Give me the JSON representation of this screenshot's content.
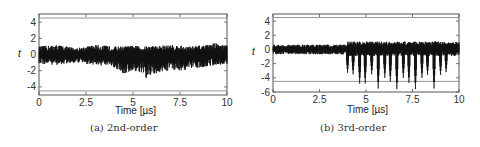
{
  "chart_data": [
    {
      "type": "line",
      "panel": "a",
      "caption": "(a) 2nd-order",
      "title": "",
      "xlabel": "Time [µs]",
      "ylabel": "t",
      "xlim": [
        0,
        10
      ],
      "ylim": [
        -5,
        5
      ],
      "xticks": [
        "0",
        "2.5",
        "5",
        "7.5",
        "10"
      ],
      "yticks": [
        "4",
        "2",
        "0",
        "-2",
        "-4"
      ],
      "ytick_values": [
        4,
        2,
        0,
        -2,
        -4
      ],
      "threshold_lines": [
        4.5,
        -4.5
      ],
      "grid": false,
      "series": [
        {
          "name": "t-statistic",
          "description": "dense noise around 0, amplitude roughly ±1.2, some excursions down to about -3.2 near 5.7 µs, up to about 1.5 near 9.4 µs",
          "envelope_x": [
            0,
            1,
            2,
            3,
            4,
            4.5,
            5,
            5.5,
            5.7,
            6,
            6.5,
            7,
            7.5,
            8,
            8.5,
            9,
            9.4,
            10
          ],
          "envelope_max": [
            1.0,
            1.2,
            0.8,
            1.2,
            1.0,
            1.0,
            1.1,
            1.0,
            1.0,
            1.1,
            1.1,
            1.2,
            1.1,
            1.0,
            1.1,
            1.2,
            1.5,
            1.1
          ],
          "envelope_min": [
            -1.2,
            -1.3,
            -1.0,
            -1.3,
            -1.6,
            -2.5,
            -2.0,
            -2.4,
            -3.2,
            -2.6,
            -2.2,
            -1.9,
            -2.0,
            -1.9,
            -1.6,
            -1.5,
            -1.3,
            -1.2
          ]
        }
      ]
    },
    {
      "type": "line",
      "panel": "b",
      "caption": "(b) 3rd-order",
      "title": "",
      "xlabel": "Time [µs]",
      "ylabel": "t",
      "xlim": [
        0,
        10
      ],
      "ylim": [
        -6,
        5
      ],
      "xticks": [
        "0",
        "2.5",
        "5",
        "7.5",
        "10"
      ],
      "yticks": [
        "4",
        "2",
        "0",
        "-2",
        "-4",
        "-6"
      ],
      "ytick_values": [
        4,
        2,
        0,
        -2,
        -4,
        -6
      ],
      "threshold_lines": [
        4.5,
        -4.5
      ],
      "grid": false,
      "series": [
        {
          "name": "t-statistic",
          "description": "noise around 0 (±0.8) for 0–4 µs, then periodic negative spikes from ~4 µs onward, many crossing -4.5",
          "spike_x": [
            4.0,
            4.3,
            4.65,
            4.95,
            5.3,
            5.65,
            6.0,
            6.3,
            6.65,
            7.0,
            7.3,
            7.65,
            8.0,
            8.3,
            8.65,
            9.0,
            9.3
          ],
          "spike_min": [
            -3.3,
            -3.5,
            -4.8,
            -4.8,
            -3.5,
            -5.5,
            -4.0,
            -4.5,
            -5.6,
            -4.0,
            -4.7,
            -5.6,
            -4.0,
            -3.6,
            -5.5,
            -3.6,
            -3.2
          ],
          "baseline_max": 0.8,
          "baseline_min": -0.8
        }
      ]
    }
  ]
}
